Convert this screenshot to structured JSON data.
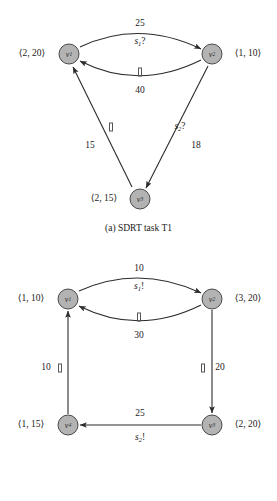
{
  "figures": [
    {
      "id": "t1",
      "caption": "(a) SDRT task T1",
      "nodes": [
        {
          "name": "v1",
          "base": "v",
          "sub": "1",
          "vertex_label": "⟨2, 20⟩"
        },
        {
          "name": "v2",
          "base": "v",
          "sub": "2",
          "vertex_label": "⟨1, 10⟩"
        },
        {
          "name": "v3",
          "base": "v",
          "sub": "3",
          "vertex_label": "⟨2, 15⟩"
        }
      ],
      "edges": [
        {
          "from": "v1",
          "to": "v2",
          "weight": "25",
          "signal": "s₁?",
          "signal_base": "s",
          "signal_sub": "1",
          "signal_mark": "?"
        },
        {
          "from": "v2",
          "to": "v1",
          "weight": "40",
          "signal": "",
          "signal_base": "",
          "signal_sub": "",
          "signal_mark": ""
        },
        {
          "from": "v3",
          "to": "v1",
          "weight": "15",
          "signal": "",
          "signal_base": "",
          "signal_sub": "",
          "signal_mark": ""
        },
        {
          "from": "v2",
          "to": "v3",
          "weight": "18",
          "signal": "s₂?",
          "signal_base": "s",
          "signal_sub": "2",
          "signal_mark": "?"
        }
      ]
    },
    {
      "id": "t2",
      "caption": "(b) SDRT task T2",
      "nodes": [
        {
          "name": "v1",
          "base": "v",
          "sub": "1",
          "vertex_label": "⟨1, 10⟩"
        },
        {
          "name": "v2",
          "base": "v",
          "sub": "2",
          "vertex_label": "⟨3, 20⟩"
        },
        {
          "name": "v3",
          "base": "v",
          "sub": "3",
          "vertex_label": "⟨2, 20⟩"
        },
        {
          "name": "v4",
          "base": "v",
          "sub": "4",
          "vertex_label": "⟨1, 15⟩"
        }
      ],
      "edges": [
        {
          "from": "v1",
          "to": "v2",
          "weight": "10",
          "signal": "s₁!",
          "signal_base": "s",
          "signal_sub": "1",
          "signal_mark": "!"
        },
        {
          "from": "v2",
          "to": "v1",
          "weight": "30",
          "signal": "",
          "signal_base": "",
          "signal_sub": "",
          "signal_mark": ""
        },
        {
          "from": "v2",
          "to": "v3",
          "weight": "20",
          "signal": "",
          "signal_base": "",
          "signal_sub": "",
          "signal_mark": ""
        },
        {
          "from": "v3",
          "to": "v4",
          "weight": "25",
          "signal": "s₂!",
          "signal_base": "s",
          "signal_sub": "2",
          "signal_mark": "!"
        },
        {
          "from": "v4",
          "to": "v1",
          "weight": "10",
          "signal": "",
          "signal_base": "",
          "signal_sub": "",
          "signal_mark": ""
        }
      ]
    }
  ],
  "t1": {
    "caption": "(a) SDRT task T1",
    "node_v1_base": "v",
    "node_v1_sub": "1",
    "node_v1_vlabel": "⟨2, 20⟩",
    "node_v2_base": "v",
    "node_v2_sub": "2",
    "node_v2_vlabel": "⟨1, 10⟩",
    "node_v3_base": "v",
    "node_v3_sub": "3",
    "node_v3_vlabel": "⟨2, 15⟩",
    "w_v1v2": "25",
    "sig_v1v2_base": "s",
    "sig_v1v2_sub": "1",
    "sig_v1v2_mark": "?",
    "w_v2v1": "40",
    "w_v3v1": "15",
    "w_v2v3": "18",
    "sig_v2v3_base": "s",
    "sig_v2v3_sub": "2",
    "sig_v2v3_mark": "?"
  },
  "t2": {
    "caption": "(b) SDRT task T2",
    "node_v1_base": "v",
    "node_v1_sub": "1",
    "node_v1_vlabel": "⟨1, 10⟩",
    "node_v2_base": "v",
    "node_v2_sub": "2",
    "node_v2_vlabel": "⟨3, 20⟩",
    "node_v3_base": "v",
    "node_v3_sub": "3",
    "node_v3_vlabel": "⟨2, 20⟩",
    "node_v4_base": "v",
    "node_v4_sub": "4",
    "node_v4_vlabel": "⟨1, 15⟩",
    "w_v1v2": "10",
    "sig_v1v2_base": "s",
    "sig_v1v2_sub": "1",
    "sig_v1v2_mark": "!",
    "w_v2v1": "30",
    "w_v2v3": "20",
    "w_v3v4": "25",
    "sig_v3v4_base": "s",
    "sig_v3v4_sub": "2",
    "sig_v3v4_mark": "!",
    "w_v4v1": "10"
  },
  "colors": {
    "node_fill": "#b3b3b3",
    "node_stroke": "#4a4a4a",
    "edge_stroke": "#2b2b2b",
    "text": "#1a1a1a",
    "background": "#ffffff"
  }
}
